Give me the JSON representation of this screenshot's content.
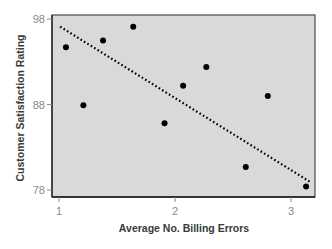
{
  "chart_data": {
    "type": "scatter",
    "title": "",
    "xlabel": "Average No. Billing Errors",
    "ylabel": "Customer Satisfaction Rating",
    "xlim": [
      0.94,
      3.21
    ],
    "ylim": [
      77.2,
      98.5
    ],
    "x_ticks": [
      1,
      2,
      3
    ],
    "y_ticks": [
      78,
      88,
      98
    ],
    "grid": false,
    "legend": null,
    "series": [
      {
        "name": "Observations",
        "marker": "circle",
        "color": "#000000",
        "points": [
          {
            "x": 1.06,
            "y": 94.7
          },
          {
            "x": 1.21,
            "y": 87.9
          },
          {
            "x": 1.38,
            "y": 95.5
          },
          {
            "x": 1.64,
            "y": 97.1
          },
          {
            "x": 1.91,
            "y": 85.8
          },
          {
            "x": 2.07,
            "y": 90.2
          },
          {
            "x": 2.27,
            "y": 92.4
          },
          {
            "x": 2.61,
            "y": 80.7
          },
          {
            "x": 2.8,
            "y": 89.0
          },
          {
            "x": 3.13,
            "y": 78.4
          }
        ]
      }
    ],
    "trendline": {
      "name": "Linear fit",
      "style": "dotted",
      "color": "#000000",
      "start": {
        "x": 1.01,
        "y": 97.1
      },
      "end": {
        "x": 3.17,
        "y": 78.9
      }
    },
    "plot_background": "#d9d9d9",
    "frame_color": "#4a4a4a"
  }
}
